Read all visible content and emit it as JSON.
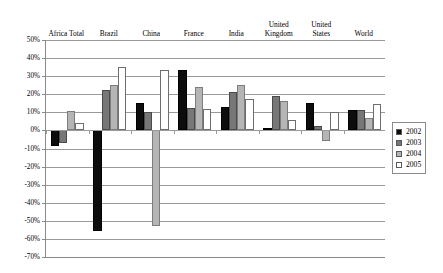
{
  "chart_data": {
    "type": "bar",
    "title": "",
    "xlabel": "",
    "ylabel": "",
    "ylim": [
      -70,
      50
    ],
    "ytick_step": 10,
    "ytick_labels": [
      "50%",
      "40%",
      "30%",
      "20%",
      "10%",
      "0%",
      "-10%",
      "-20%",
      "-30%",
      "-40%",
      "-50%",
      "-60%",
      "-70%"
    ],
    "ytick_values": [
      50,
      40,
      30,
      20,
      10,
      0,
      -10,
      -20,
      -30,
      -40,
      -50,
      -60,
      -70
    ],
    "grid": true,
    "value_unit": "percent",
    "categories": [
      "Africa Total",
      "Brazil",
      "China",
      "France",
      "India",
      "United\nKingdom",
      "United\nStates",
      "World"
    ],
    "legend_position": "right",
    "series": [
      {
        "name": "2002",
        "color": "#0d0d0d",
        "values": [
          -8.5,
          -55.5,
          15.0,
          33.5,
          13.0,
          1.5,
          15.0,
          11.5
        ]
      },
      {
        "name": "2003",
        "color": "#777777",
        "values": [
          -7.0,
          22.5,
          10.0,
          12.5,
          21.5,
          19.0,
          2.5,
          11.5
        ]
      },
      {
        "name": "2004",
        "color": "#b5b5b5",
        "values": [
          10.5,
          25.0,
          -53.0,
          24.0,
          25.0,
          16.0,
          -6.0,
          7.0
        ]
      },
      {
        "name": "2005",
        "color": "#ffffff",
        "values": [
          4.0,
          35.0,
          33.5,
          12.0,
          17.5,
          6.0,
          10.0,
          14.5
        ]
      }
    ]
  },
  "legend": {
    "entries": [
      {
        "label": "2002",
        "swatch": "#0d0d0d"
      },
      {
        "label": "2003",
        "swatch": "#777777"
      },
      {
        "label": "2004",
        "swatch": "#b5b5b5"
      },
      {
        "label": "2005",
        "swatch": "#ffffff"
      }
    ]
  },
  "colors": {
    "gridline": "#9a9a9a",
    "axis": "#8a8a8a",
    "background": "#ffffff",
    "text": "#000000"
  }
}
